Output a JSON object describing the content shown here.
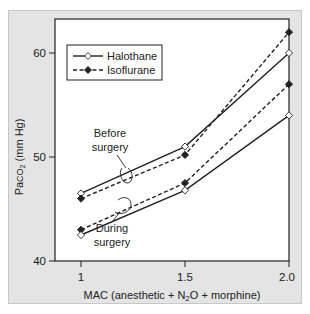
{
  "chart_data": {
    "type": "line",
    "title": "",
    "xlabel": "MAC (anesthetic + N2O + morphine)",
    "xlabel_parts": {
      "pre": "MAC (anesthetic + N",
      "sub": "2",
      "post": "O + morphine)"
    },
    "ylabel": "PaCO2 (mm Hg)",
    "ylabel_parts": {
      "pre": "Pa",
      "mid": "CO",
      "sub": "2",
      "post": " (mm Hg)"
    },
    "x": [
      1,
      1.5,
      2.0
    ],
    "x_tick_labels": [
      "1",
      "1.5",
      "2.0"
    ],
    "y_ticks": [
      40,
      50,
      60
    ],
    "y_tick_labels": [
      "40",
      "50",
      "60"
    ],
    "ylim": [
      40,
      63
    ],
    "xlim": [
      0.85,
      2.0
    ],
    "grid": false,
    "legend_position": "upper left",
    "legend": [
      {
        "name": "Halothane",
        "line": "solid",
        "marker": "open-diamond"
      },
      {
        "name": "Isoflurane",
        "line": "dashed",
        "marker": "filled-diamond"
      }
    ],
    "series": [
      {
        "name": "Halothane (before surgery)",
        "drug": "Halothane",
        "condition": "Before surgery",
        "values": [
          46.5,
          51,
          60
        ]
      },
      {
        "name": "Isoflurane (before surgery)",
        "drug": "Isoflurane",
        "condition": "Before surgery",
        "values": [
          46,
          50.2,
          62
        ]
      },
      {
        "name": "Isoflurane (during surgery)",
        "drug": "Isoflurane",
        "condition": "During surgery",
        "values": [
          43,
          47.5,
          57
        ]
      },
      {
        "name": "Halothane (during surgery)",
        "drug": "Halothane",
        "condition": "During surgery",
        "values": [
          42.5,
          46.8,
          54
        ]
      }
    ],
    "annotations": [
      {
        "text_line1": "Before",
        "text_line2": "surgery"
      },
      {
        "text_line1": "During",
        "text_line2": "surgery"
      }
    ]
  }
}
